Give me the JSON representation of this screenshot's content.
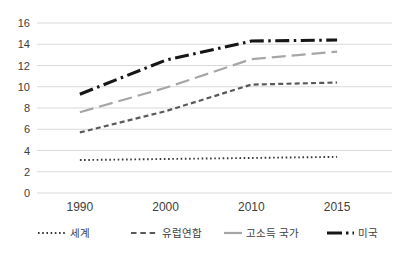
{
  "chart_data": {
    "type": "line",
    "categories": [
      "1990",
      "2000",
      "2010",
      "2015"
    ],
    "series": [
      {
        "name": "세계",
        "values": [
          3.1,
          3.2,
          3.3,
          3.4
        ],
        "color": "#3a3a3a",
        "style": "dotted"
      },
      {
        "name": "유럽연합",
        "values": [
          5.7,
          7.7,
          10.2,
          10.4
        ],
        "color": "#595959",
        "style": "dashed"
      },
      {
        "name": "고소득 국가",
        "values": [
          7.6,
          9.9,
          12.6,
          13.3
        ],
        "color": "#a6a6a6",
        "style": "long-dash"
      },
      {
        "name": "미국",
        "values": [
          9.3,
          12.5,
          14.3,
          14.4
        ],
        "color": "#161616",
        "style": "dash-dot"
      }
    ],
    "title": "",
    "xlabel": "",
    "ylabel": "",
    "ylim": [
      0,
      16
    ],
    "ytick_step": 2,
    "grid": "horizontal-only",
    "legend_position": "bottom"
  },
  "axes": {
    "y_ticks": [
      "0",
      "2",
      "4",
      "6",
      "8",
      "10",
      "12",
      "14",
      "16"
    ],
    "x_ticks": [
      "1990",
      "2000",
      "2010",
      "2015"
    ]
  },
  "colors": {
    "background": "#ffffff",
    "gridline": "#d9d9d9",
    "tick_text": "#404040"
  }
}
